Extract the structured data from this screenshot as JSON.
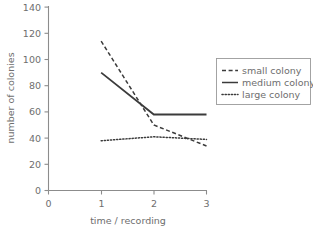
{
  "chart_data": {
    "type": "line",
    "title": "",
    "xlabel": "time / recording",
    "ylabel": "number of colonies",
    "xlim": [
      0,
      3
    ],
    "ylim": [
      0,
      140
    ],
    "xticks": [
      "0",
      "1",
      "2",
      "3"
    ],
    "yticks": [
      "0",
      "20",
      "40",
      "60",
      "80",
      "100",
      "120",
      "140"
    ],
    "grid": false,
    "legend_position": "right",
    "x": [
      1,
      2,
      3
    ],
    "series": [
      {
        "name": "small colony",
        "style": "dashed",
        "values": [
          114,
          50,
          34
        ]
      },
      {
        "name": "medium colony",
        "style": "solid",
        "values": [
          90,
          58,
          58
        ]
      },
      {
        "name": "large colony",
        "style": "dotted",
        "values": [
          38,
          41,
          39
        ]
      }
    ]
  },
  "axes": {
    "x_label": "time / recording",
    "y_label": "number of colonies",
    "x_ticks": [
      "0",
      "1",
      "2",
      "3"
    ],
    "y_ticks": [
      "0",
      "20",
      "40",
      "60",
      "80",
      "100",
      "120",
      "140"
    ]
  },
  "legend": {
    "entries": [
      {
        "label": "small colony",
        "style": "dashed"
      },
      {
        "label": "medium colony",
        "style": "solid"
      },
      {
        "label": "large colony",
        "style": "dotted"
      }
    ]
  },
  "colors": {
    "line": "#3b3b3b",
    "axis": "#8c8c8c",
    "text": "#6e6e6e",
    "background": "#ffffff",
    "legend_border": "#9a9a9a"
  }
}
